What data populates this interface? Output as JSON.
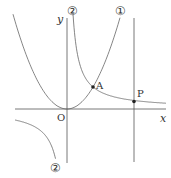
{
  "diagram": {
    "type": "function-graph",
    "axes": {
      "x_label": "x",
      "y_label": "y",
      "origin_label": "O"
    },
    "curves": [
      {
        "id": "curve-1",
        "label": "①",
        "kind": "parabola",
        "description": "y = a x^2"
      },
      {
        "id": "curve-2",
        "label": "②",
        "kind": "hyperbola",
        "description": "y = b / x"
      }
    ],
    "points": [
      {
        "id": "A",
        "label": "A",
        "description": "intersection of ① and ②"
      },
      {
        "id": "P",
        "label": "P",
        "description": "point on ② on the vertical line"
      }
    ],
    "vertical_line": {
      "description": "line through P parallel to y-axis"
    },
    "colors": {
      "stroke": "#555555",
      "text": "#333333",
      "background": "#ffffff"
    }
  }
}
